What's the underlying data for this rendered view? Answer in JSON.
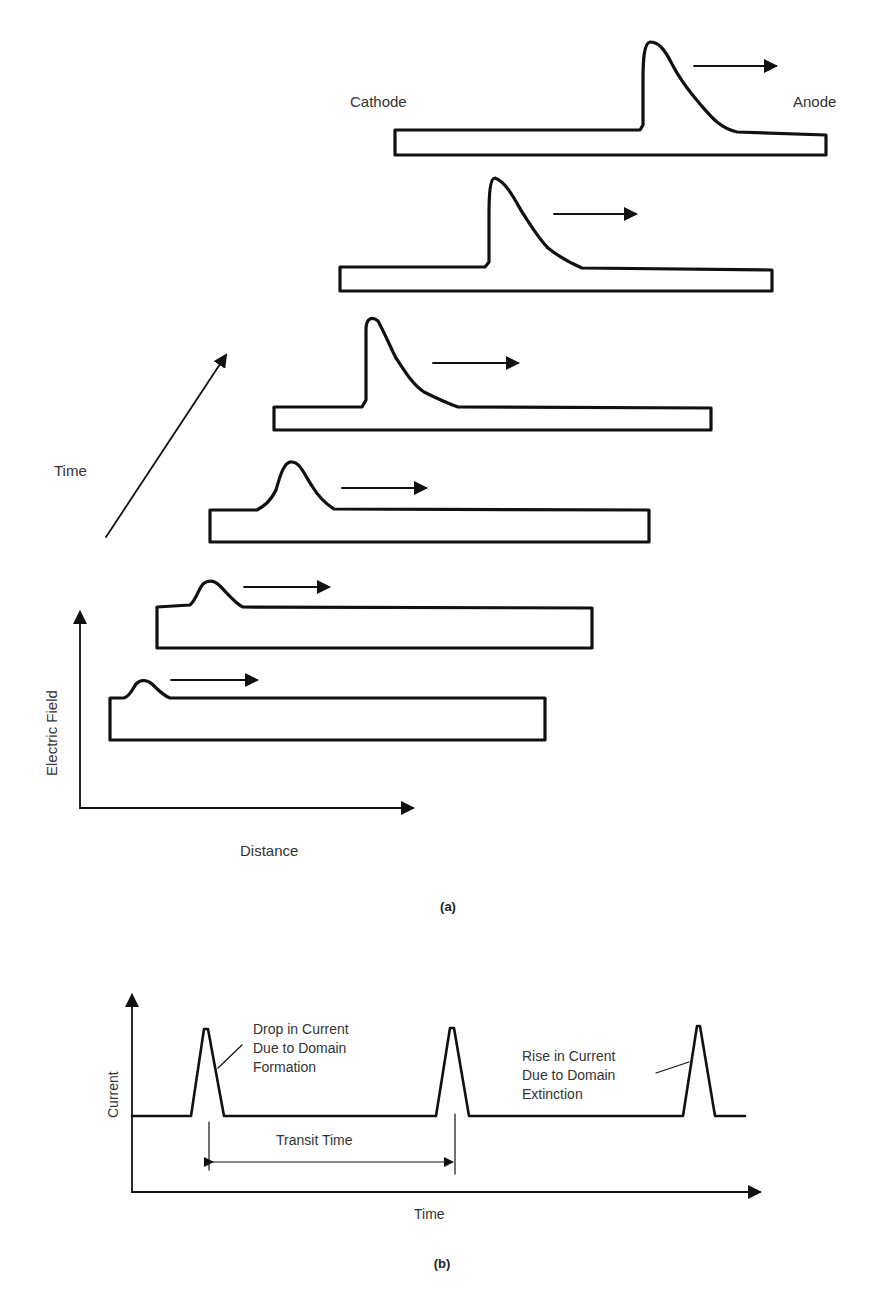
{
  "figure_a": {
    "caption": "(a)",
    "labels": {
      "cathode": "Cathode",
      "anode": "Anode",
      "time_axis": "Time",
      "y_axis": "Electric Field",
      "x_axis": "Distance"
    },
    "stages": [
      {
        "stage": 1,
        "domain": "small bump near cathode"
      },
      {
        "stage": 2,
        "domain": "small bump"
      },
      {
        "stage": 3,
        "domain": "growing bump"
      },
      {
        "stage": 4,
        "domain": "mature domain (tall, skewed)"
      },
      {
        "stage": 5,
        "domain": "mature domain (tall, skewed)"
      },
      {
        "stage": 6,
        "domain": "mature domain near anode"
      }
    ]
  },
  "figure_b": {
    "caption": "(b)",
    "labels": {
      "y_axis": "Current",
      "x_axis": "Time",
      "transit_time": "Transit Time",
      "annotation_left": [
        "Drop in Current",
        "Due to Domain",
        "Formation"
      ],
      "annotation_right": [
        "Rise in Current",
        "Due to Domain",
        "Extinction"
      ]
    },
    "peaks": 3
  }
}
